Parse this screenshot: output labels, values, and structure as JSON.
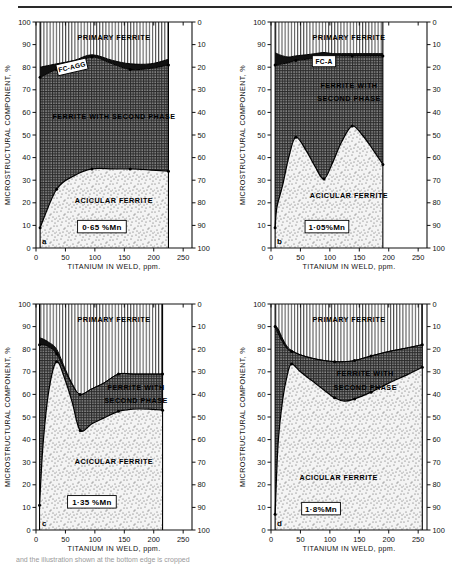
{
  "figure": {
    "top_rule": true,
    "caption": "and the illustration shown at the bottom edge is cropped"
  },
  "axes": {
    "ylabel": "MICROSTRUCTURAL COMPONENT, %",
    "xlabel": "TITANIUM IN WELD, ppm.",
    "y_ticks": [
      0,
      10,
      20,
      30,
      40,
      50,
      60,
      70,
      80,
      90,
      100
    ],
    "y_right_ticks": [
      0,
      10,
      20,
      30,
      40,
      50,
      60,
      70,
      80,
      90,
      100
    ],
    "x_ticks": [
      0,
      50,
      100,
      150,
      200,
      250
    ],
    "xlim": [
      0,
      265
    ],
    "ylim": [
      0,
      100
    ]
  },
  "regions": {
    "primary_ferrite": "PRIMARY FERRITE",
    "ferrite_second_phase": "FERRITE WITH SECOND PHASE",
    "ferrite_second_phase_l1": "FERRITE WITH",
    "ferrite_second_phase_l2": "SECOND PHASE",
    "acicular_ferrite": "ACICULAR FERRITE",
    "fc_agg": "FC-AGG",
    "fc_a": "FC-A"
  },
  "colors": {
    "primary_ferrite_fill": "#ffffff",
    "second_phase_fill": "#6d6d6d",
    "acicular_fill": "#efefef",
    "fc_band_fill": "#111111",
    "line": "#000000",
    "axis": "#111111"
  },
  "chart_data": [
    {
      "type": "area",
      "panel": "a",
      "panel_letter": "a",
      "title": "0·65 %Mn",
      "mn_label": "0·65 %Mn",
      "xlabel": "TITANIUM IN WELD, ppm.",
      "ylabel": "MICROSTRUCTURAL COMPONENT, %",
      "xlim": [
        0,
        265
      ],
      "ylim": [
        0,
        100
      ],
      "grid": true,
      "legend_position": "inline-region-labels",
      "x": [
        7,
        35,
        65,
        95,
        130,
        160,
        195,
        225
      ],
      "series": [
        {
          "name": "acicular ferrite (upper boundary)",
          "values": [
            9,
            26,
            32,
            35,
            35,
            35,
            34.5,
            34
          ]
        },
        {
          "name": "ferrite with second phase (upper boundary)",
          "values": [
            75.5,
            79,
            81,
            84.5,
            81.5,
            79,
            79.5,
            81
          ]
        },
        {
          "name": "FC-AGG band top",
          "values": [
            80,
            81.5,
            83,
            85.5,
            83,
            81.5,
            81.5,
            83.5
          ]
        }
      ],
      "markers_x": [
        7,
        35,
        95,
        160,
        225
      ],
      "data_end_x": 225
    },
    {
      "type": "area",
      "panel": "b",
      "panel_letter": "b",
      "title": "1·05 %Mn",
      "mn_label": "1·05%Mn",
      "xlabel": "TITANIUM IN WELD, ppm.",
      "ylabel": "MICROSTRUCTURAL COMPONENT, %",
      "xlim": [
        0,
        265
      ],
      "ylim": [
        0,
        100
      ],
      "grid": true,
      "legend_position": "inline-region-labels",
      "x": [
        7,
        10,
        20,
        30,
        42,
        60,
        75,
        90,
        105,
        120,
        138,
        155,
        172,
        190
      ],
      "series": [
        {
          "name": "acicular ferrite (upper boundary)",
          "values": [
            9,
            18,
            28,
            40,
            49,
            43,
            36,
            30.5,
            38,
            47,
            54,
            50,
            44,
            37
          ]
        },
        {
          "name": "ferrite with second phase (upper boundary)",
          "values": [
            81,
            81,
            81.5,
            82,
            83,
            83.5,
            84,
            84.5,
            85,
            85,
            85,
            85,
            85,
            85
          ]
        },
        {
          "name": "FC-A band top",
          "values": [
            86.5,
            86,
            85,
            84.5,
            85,
            85.5,
            86,
            86.5,
            86,
            86,
            86,
            86,
            86,
            86
          ]
        }
      ],
      "markers_x": [
        7,
        42,
        90,
        138,
        190
      ],
      "data_end_x": 190
    },
    {
      "type": "area",
      "panel": "c",
      "panel_letter": "c",
      "title": "1·35 %Mn",
      "mn_label": "1·35 %Mn",
      "xlabel": "TITANIUM IN WELD, ppm.",
      "ylabel": "MICROSTRUCTURAL COMPONENT, %",
      "xlim": [
        0,
        265
      ],
      "ylim": [
        0,
        100
      ],
      "grid": true,
      "legend_position": "inline-region-labels",
      "x": [
        6,
        12,
        22,
        35,
        50,
        62,
        75,
        95,
        115,
        140,
        165,
        190,
        215
      ],
      "series": [
        {
          "name": "acicular ferrite (upper boundary)",
          "values": [
            11,
            38,
            62,
            74.5,
            66,
            56,
            44,
            47,
            49.5,
            52.5,
            53.5,
            53.5,
            53
          ]
        },
        {
          "name": "ferrite with second phase (upper boundary)",
          "values": [
            82,
            82,
            81,
            78,
            70,
            64,
            60,
            62.5,
            65,
            69,
            69,
            69,
            69
          ]
        },
        {
          "name": "FC band top",
          "values": [
            85,
            84.5,
            83,
            80,
            71,
            64.5,
            60,
            62.5,
            65,
            69,
            69,
            69,
            69
          ]
        }
      ],
      "markers_x": [
        6,
        35,
        75,
        140,
        215
      ],
      "data_end_x": 215
    },
    {
      "type": "area",
      "panel": "d",
      "panel_letter": "d",
      "title": "1·8 %Mn",
      "mn_label": "1·8%Mn",
      "xlabel": "TITANIUM IN WELD, ppm.",
      "ylabel": "MICROSTRUCTURAL COMPONENT, %",
      "xlim": [
        0,
        265
      ],
      "ylim": [
        0,
        100
      ],
      "grid": true,
      "legend_position": "inline-region-labels",
      "x": [
        7,
        12,
        20,
        28,
        35,
        50,
        70,
        90,
        108,
        125,
        142,
        170,
        200,
        230,
        257
      ],
      "series": [
        {
          "name": "acicular ferrite (upper boundary)",
          "values": [
            7,
            38,
            58,
            69,
            73.5,
            70,
            66,
            62,
            58.5,
            57,
            58,
            61,
            65,
            68.5,
            72
          ]
        },
        {
          "name": "ferrite with second phase (upper boundary)",
          "values": [
            90,
            87,
            83,
            80,
            79,
            77.5,
            76,
            75,
            74.5,
            74.5,
            75,
            77,
            79,
            80.5,
            82
          ]
        },
        {
          "name": "FC band top",
          "values": [
            90.5,
            89,
            84.5,
            81,
            79.5,
            77.5,
            76,
            75,
            74.5,
            74.5,
            75,
            77,
            79,
            80.5,
            82
          ]
        }
      ],
      "markers_x": [
        7,
        35,
        108,
        142,
        170,
        257
      ],
      "data_end_x": 257
    }
  ]
}
